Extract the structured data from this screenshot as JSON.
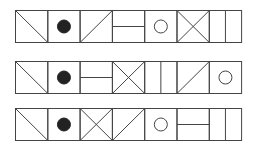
{
  "figure": {
    "stroke_color": "#444444",
    "fill_color": "#222222",
    "background": "#ffffff",
    "cell_width": 32.3,
    "cell_height": 33,
    "rows": [
      {
        "label": "row-1",
        "cells": [
          "diag-down",
          "filled-circle",
          "diag-up",
          "horizontal-line",
          "hollow-circle",
          "x-cross",
          "vertical-line"
        ]
      },
      {
        "label": "row-2",
        "cells": [
          "diag-down",
          "filled-circle",
          "horizontal-line",
          "x-cross",
          "vertical-line",
          "diag-up",
          "hollow-circle"
        ]
      },
      {
        "label": "row-3",
        "cells": [
          "diag-down",
          "filled-circle",
          "x-cross",
          "diag-up",
          "hollow-circle",
          "horizontal-line",
          "vertical-line"
        ]
      }
    ]
  }
}
